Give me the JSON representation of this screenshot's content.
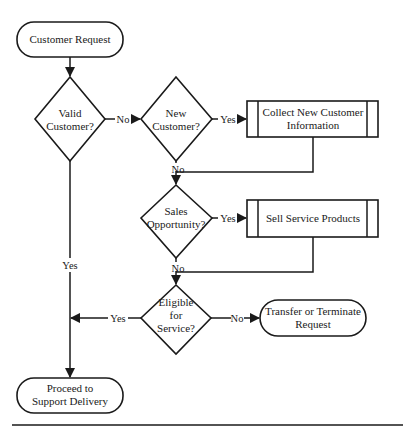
{
  "diagram": {
    "type": "flowchart",
    "nodes": {
      "start": {
        "shape": "terminator",
        "lines": [
          "Customer Request"
        ]
      },
      "valid": {
        "shape": "decision",
        "lines": [
          "Valid",
          "Customer?"
        ]
      },
      "new": {
        "shape": "decision",
        "lines": [
          "New",
          "Customer?"
        ]
      },
      "collect": {
        "shape": "predefined-process",
        "lines": [
          "Collect New Customer",
          "Information"
        ]
      },
      "sales": {
        "shape": "decision",
        "lines": [
          "Sales",
          "Opportunity?"
        ]
      },
      "sell": {
        "shape": "predefined-process",
        "lines": [
          "Sell Service Products"
        ]
      },
      "eligible": {
        "shape": "decision",
        "lines": [
          "Eligible",
          "for",
          "Service?"
        ]
      },
      "transfer": {
        "shape": "terminator",
        "lines": [
          "Transfer or Terminate",
          "Request"
        ]
      },
      "proceed": {
        "shape": "terminator",
        "lines": [
          "Proceed to",
          "Support Delivery"
        ]
      }
    },
    "edges": {
      "valid_no": "No",
      "valid_yes": "Yes",
      "new_yes": "Yes",
      "new_no": "No",
      "sales_yes": "Yes",
      "sales_no": "No",
      "eligible_yes": "Yes",
      "eligible_no": "No"
    },
    "colors": {
      "stroke": "#1a1a1a",
      "fill": "#ffffff"
    }
  }
}
